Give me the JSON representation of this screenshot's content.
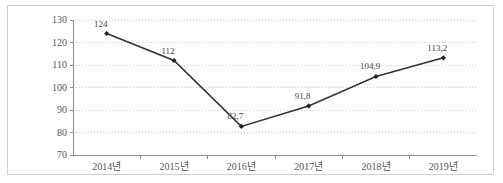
{
  "chart_data": {
    "type": "line",
    "title": "",
    "subtitle": "",
    "xlabel": "",
    "ylabel": "",
    "categories": [
      "2014년",
      "2015년",
      "2016년",
      "2017년",
      "2018년",
      "2019년"
    ],
    "values": [
      124,
      112,
      82.7,
      91.8,
      104.9,
      113.2
    ],
    "point_labels": [
      "124",
      "112",
      "82,7",
      "91,8",
      "104,9",
      "113,2"
    ],
    "ylim": [
      70,
      130
    ],
    "ytick_labels": [
      "130",
      "120",
      "110",
      "100",
      "90",
      "80",
      "70"
    ],
    "ytick_values": [
      130,
      120,
      110,
      100,
      90,
      80,
      70
    ],
    "grid": true,
    "grid_style": "dotted",
    "legend": false,
    "legend_position": "none",
    "series": [
      {
        "name": "",
        "values": [
          124,
          112,
          82.7,
          91.8,
          104.9,
          113.2
        ]
      }
    ]
  },
  "style": {
    "line_color": "#333333",
    "marker_color": "#222222",
    "grid_color": "#c8c8c8",
    "axis_color": "#8c8c8c",
    "frame_color": "#cfcfcf",
    "label_color": "#555555",
    "background": "#ffffff"
  }
}
